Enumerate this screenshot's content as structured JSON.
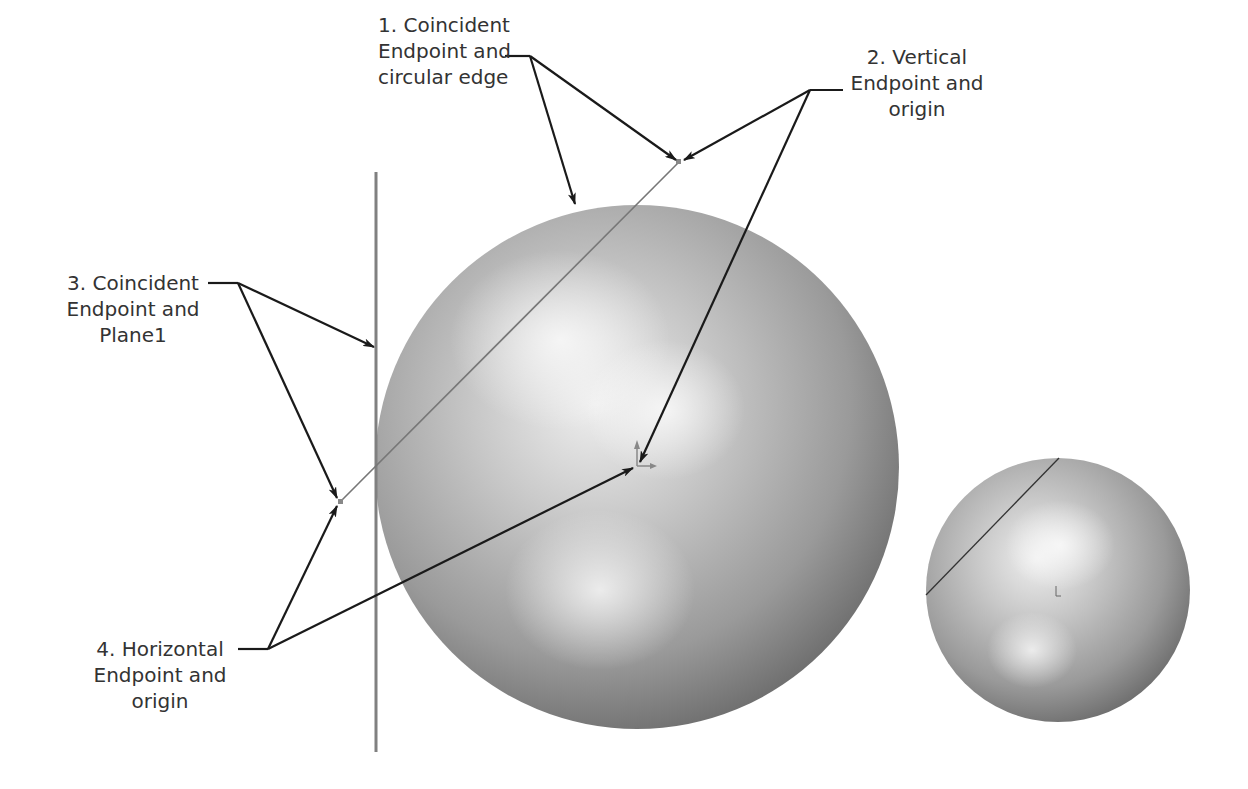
{
  "figure": {
    "background": "#ffffff",
    "line_color": "#1a1a1a",
    "sketch_line_color": "#777777",
    "plane_color": "#808080"
  },
  "callouts": [
    {
      "id": "1",
      "lines": [
        "1. Coincident",
        "Endpoint and",
        "circular edge"
      ]
    },
    {
      "id": "2",
      "lines": [
        "2. Vertical",
        "Endpoint and",
        "origin"
      ]
    },
    {
      "id": "3",
      "lines": [
        "3. Coincident",
        "Endpoint and",
        "Plane1"
      ]
    },
    {
      "id": "4",
      "lines": [
        "4. Horizontal",
        "Endpoint and",
        "origin"
      ]
    }
  ],
  "views": {
    "large_sphere": {
      "cx": 637,
      "cy": 467,
      "r": 262
    },
    "small_sphere": {
      "cx": 1058,
      "cy": 590,
      "r": 132
    },
    "plane1": {
      "x": 376,
      "y1": 172,
      "y2": 752
    },
    "sketch_line": {
      "x1": 340,
      "y1": 502,
      "x2": 679,
      "y2": 162
    },
    "origin": {
      "x": 637,
      "y": 466
    }
  }
}
